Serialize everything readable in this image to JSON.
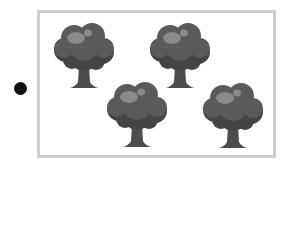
{
  "bullet": {
    "icon": "filled-circle",
    "color": "#111111"
  },
  "frame": {
    "border_color": "#cccccc"
  },
  "trees": [
    {
      "name": "tree-1",
      "x": 52,
      "y": 22
    },
    {
      "name": "tree-2",
      "x": 148,
      "y": 22
    },
    {
      "name": "tree-3",
      "x": 105,
      "y": 81
    },
    {
      "name": "tree-4",
      "x": 201,
      "y": 82
    }
  ],
  "tree_count": 4,
  "colors": {
    "canopy": "#5a5a5a",
    "canopy_dark": "#454545",
    "highlight": "#8a8a8a",
    "trunk": "#4d4d4d"
  }
}
